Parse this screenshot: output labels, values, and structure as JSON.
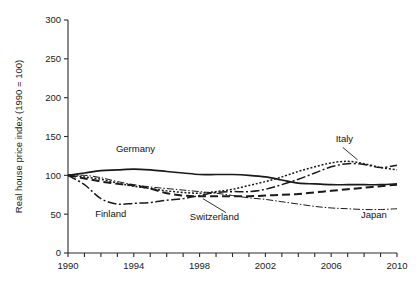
{
  "chart_data": {
    "type": "line",
    "title": "",
    "subtitle": "",
    "xlabel": "",
    "ylabel": "Real house price index (1990 = 100)",
    "xlim": [
      1990,
      2010
    ],
    "ylim": [
      0,
      300
    ],
    "ytick_values": [
      0,
      50,
      100,
      150,
      200,
      250,
      300
    ],
    "ytick_labels": [
      "0",
      "50",
      "100",
      "150",
      "200",
      "250",
      "300"
    ],
    "xtick_values": [
      1990,
      1991,
      1992,
      1993,
      1994,
      1995,
      1996,
      1997,
      1998,
      1999,
      2000,
      2001,
      2002,
      2003,
      2004,
      2005,
      2006,
      2007,
      2008,
      2009,
      2010
    ],
    "xtick_labels": [
      "1990",
      "",
      "",
      "",
      "1994",
      "",
      "",
      "",
      "1998",
      "",
      "",
      "",
      "2002",
      "",
      "",
      "",
      "2006",
      "",
      "",
      "",
      "2010"
    ],
    "xtick_labeled_values": [
      1990,
      1994,
      1998,
      2002,
      2006,
      2010
    ],
    "grid": false,
    "legend_position": "inline-annotations",
    "x": [
      1990,
      1991,
      1992,
      1993,
      1994,
      1995,
      1996,
      1997,
      1998,
      1999,
      2000,
      2001,
      2002,
      2003,
      2004,
      2005,
      2006,
      2007,
      2008,
      2009,
      2010
    ],
    "series": [
      {
        "name": "Germany",
        "style": "solid",
        "values": [
          100,
          103,
          106,
          107,
          108,
          107,
          105,
          103,
          101,
          101,
          101,
          100,
          98,
          94,
          90,
          89,
          88,
          88,
          88,
          88,
          89
        ]
      },
      {
        "name": "Finland",
        "style": "dash-dot",
        "values": [
          100,
          88,
          70,
          63,
          64,
          65,
          68,
          70,
          74,
          78,
          79,
          79,
          82,
          88,
          95,
          103,
          111,
          115,
          114,
          110,
          113
        ]
      },
      {
        "name": "Switzerland",
        "style": "long-dash",
        "values": [
          100,
          96,
          92,
          89,
          87,
          83,
          77,
          74,
          73,
          73,
          73,
          73,
          74,
          75,
          76,
          78,
          80,
          82,
          84,
          86,
          88
        ]
      },
      {
        "name": "Italy",
        "style": "dotted",
        "values": [
          100,
          98,
          95,
          90,
          86,
          83,
          80,
          78,
          77,
          79,
          82,
          87,
          92,
          98,
          105,
          111,
          116,
          118,
          115,
          110,
          107
        ]
      },
      {
        "name": "Japan",
        "style": "thin-dash-dot",
        "values": [
          100,
          100,
          97,
          92,
          88,
          85,
          83,
          81,
          79,
          77,
          74,
          71,
          69,
          66,
          63,
          60,
          58,
          57,
          56,
          56,
          57
        ]
      }
    ],
    "annotations": [
      {
        "text": "Germany",
        "x": 1994.1,
        "y": 130,
        "leader": false
      },
      {
        "text": "Finland",
        "x": 1992.6,
        "y": 46,
        "leader": false
      },
      {
        "text": "Switzerland",
        "x": 1998.9,
        "y": 42,
        "leader": true
      },
      {
        "text": "Italy",
        "x": 2006.8,
        "y": 143,
        "leader": true
      },
      {
        "text": "Japan",
        "x": 2008.6,
        "y": 45,
        "leader": false
      }
    ]
  },
  "axes": {
    "y_axis_title": "Real house price index (1990 = 100)",
    "y_labels": [
      "300",
      "250",
      "200",
      "150",
      "100",
      "50",
      "0"
    ],
    "x_labels": [
      "1990",
      "1994",
      "1998",
      "2002",
      "2006",
      "2010"
    ]
  },
  "labels": {
    "germany": "Germany",
    "finland": "Finland",
    "switzerland": "Switzerland",
    "italy": "Italy",
    "japan": "Japan"
  },
  "colors": {
    "ink": "#1a1a1a",
    "axis": "#2b2b2b",
    "background": "#ffffff"
  }
}
